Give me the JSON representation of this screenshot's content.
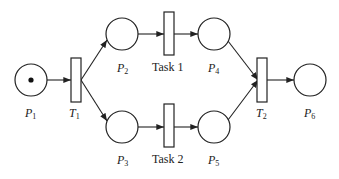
{
  "diagram": {
    "type": "petri-net",
    "colors": {
      "stroke": "#222222",
      "background": "#ffffff",
      "token": "#111111"
    },
    "places": [
      {
        "id": "P1",
        "label": "P",
        "sub": "1",
        "cx": 31,
        "cy": 80,
        "tokens": 1
      },
      {
        "id": "P2",
        "label": "P",
        "sub": "2",
        "cx": 122,
        "cy": 34,
        "tokens": 0
      },
      {
        "id": "P3",
        "label": "P",
        "sub": "3",
        "cx": 122,
        "cy": 127,
        "tokens": 0
      },
      {
        "id": "P4",
        "label": "P",
        "sub": "4",
        "cx": 214,
        "cy": 34,
        "tokens": 0
      },
      {
        "id": "P5",
        "label": "P",
        "sub": "5",
        "cx": 214,
        "cy": 127,
        "tokens": 0
      },
      {
        "id": "P6",
        "label": "P",
        "sub": "6",
        "cx": 310,
        "cy": 80,
        "tokens": 0
      }
    ],
    "transitions": [
      {
        "id": "T1",
        "label": "T",
        "sub": "1"
      },
      {
        "id": "Task1",
        "label": "Task 1"
      },
      {
        "id": "Task2",
        "label": "Task 2"
      },
      {
        "id": "T2",
        "label": "T",
        "sub": "2"
      }
    ],
    "arcs": [
      [
        "P1",
        "T1"
      ],
      [
        "T1",
        "P2"
      ],
      [
        "T1",
        "P3"
      ],
      [
        "P2",
        "Task1"
      ],
      [
        "P3",
        "Task2"
      ],
      [
        "Task1",
        "P4"
      ],
      [
        "Task2",
        "P5"
      ],
      [
        "P4",
        "T2"
      ],
      [
        "P5",
        "T2"
      ],
      [
        "T2",
        "P6"
      ]
    ]
  }
}
